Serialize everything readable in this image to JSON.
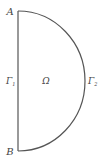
{
  "diagram": {
    "type": "half-disk domain",
    "stroke_color": "#555555",
    "labels": {
      "top_point": "A",
      "bottom_point": "B",
      "left_boundary_main": "Γ",
      "left_boundary_sub": "1",
      "right_boundary_main": "Γ",
      "right_boundary_sub": "2",
      "domain": "Ω"
    }
  }
}
